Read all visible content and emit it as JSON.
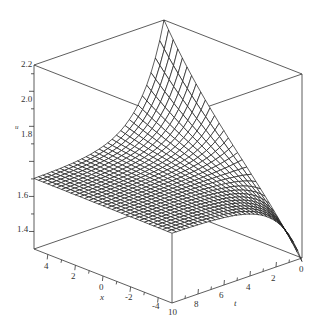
{
  "chart_data": {
    "type": "surface3d",
    "title": "",
    "axes": {
      "x": {
        "label": "x",
        "range": [
          -5,
          5
        ],
        "ticks": [
          4,
          2,
          0,
          -2,
          -4
        ]
      },
      "t": {
        "label": "t",
        "range": [
          0,
          10
        ],
        "ticks": [
          10,
          8,
          6,
          4,
          2,
          0
        ]
      },
      "u": {
        "label": "u",
        "range": [
          1.3,
          2.35
        ],
        "ticks": [
          1.4,
          1.6,
          1.8,
          2.0,
          2.2
        ]
      }
    },
    "surface_description": "Mesh surface u(x,t): nearly flat at u≈1.7 for large t; rises to a sharp peak ≈2.35 at t=0, x=5; drops to ≈1.3 at t=0, x=-5 (shaded kink region).",
    "grid": {
      "nx": 30,
      "nt": 30
    },
    "sample_values": [
      {
        "x": 5,
        "t": 10,
        "u": 1.7
      },
      {
        "x": -5,
        "t": 10,
        "u": 1.7
      },
      {
        "x": 5,
        "t": 0,
        "u": 2.35
      },
      {
        "x": -5,
        "t": 0,
        "u": 1.3
      },
      {
        "x": 0,
        "t": 0,
        "u": 1.75
      }
    ],
    "box": true,
    "legend": null
  },
  "labels": {
    "u_ticks": [
      "2.2",
      "2.0",
      "1.8",
      "1.6",
      "1.4"
    ],
    "x_ticks": [
      "4",
      "2",
      "0",
      "-2",
      "-4"
    ],
    "t_ticks": [
      "10",
      "8",
      "6",
      "4",
      "2",
      "0"
    ],
    "x_name": "x",
    "t_name": "t",
    "u_name": "u"
  }
}
